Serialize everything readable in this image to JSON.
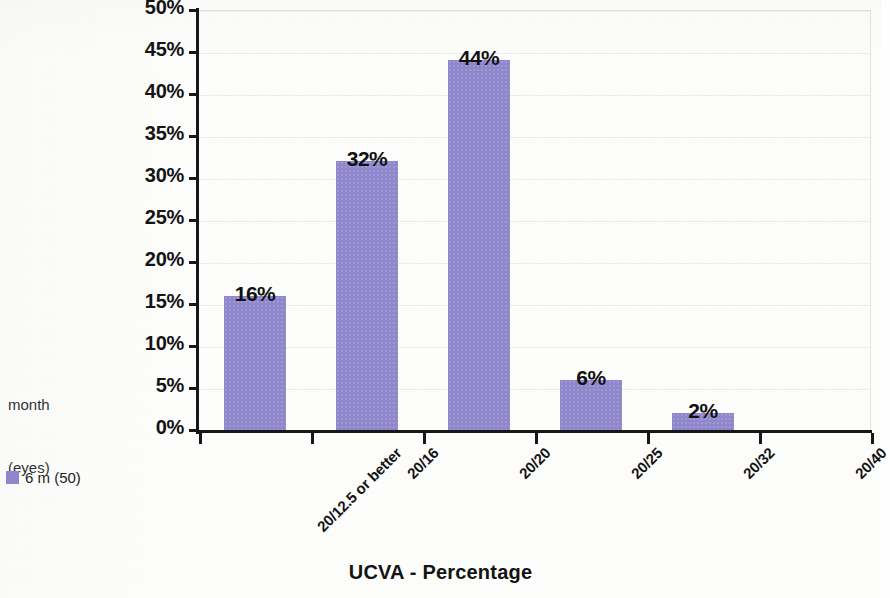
{
  "title": "UCVA - Percentage",
  "axis_caption_line1": "month",
  "axis_caption_line2": "(eyes)",
  "legend": {
    "label": "6 m (50)",
    "swatch_color": "#8f86cc"
  },
  "chart_data": {
    "type": "bar",
    "title": "UCVA - Percentage",
    "xlabel": "",
    "ylabel": "",
    "categories": [
      "20/12.5 or better",
      "20/16",
      "20/20",
      "20/25",
      "20/32",
      "20/40"
    ],
    "series": [
      {
        "name": "6 m (50)",
        "color": "#8f86cc",
        "values": [
          16,
          32,
          44,
          6,
          2,
          0
        ],
        "value_labels": [
          "16%",
          "32%",
          "44%",
          "6%",
          "2%",
          ""
        ]
      }
    ],
    "ylim": [
      0,
      50
    ],
    "ytick_values": [
      0,
      5,
      10,
      15,
      20,
      25,
      30,
      35,
      40,
      45,
      50
    ],
    "ytick_labels": [
      "0%",
      "5%",
      "10%",
      "15%",
      "20%",
      "25%",
      "30%",
      "35%",
      "40%",
      "45%",
      "50%"
    ],
    "grid": true,
    "legend_position": "left-bottom",
    "xtick_rotation": -45
  }
}
